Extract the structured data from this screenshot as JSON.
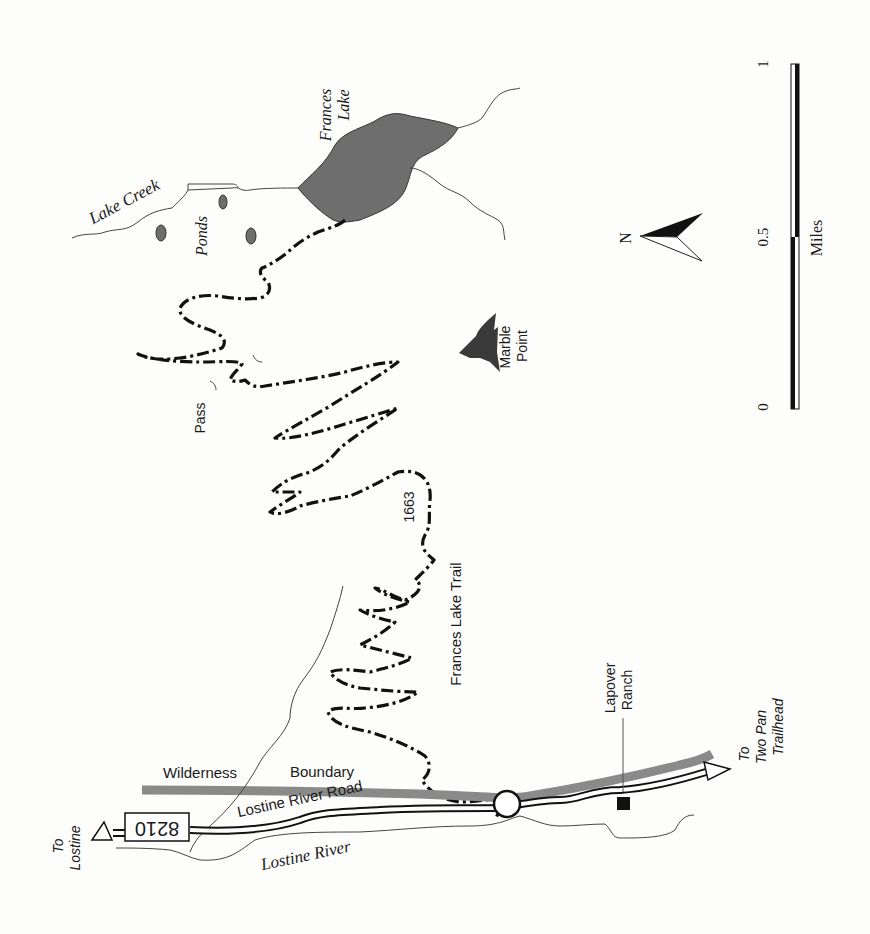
{
  "map": {
    "title": "Frances Lake Trail",
    "trail": {
      "name": "Frances Lake Trail",
      "number": "1663"
    },
    "features": {
      "lake": "Frances Lake",
      "creek": "Lake Creek",
      "ponds": "Ponds",
      "peak": "Marble Point",
      "pass": "Pass",
      "river": "Lostine River",
      "road": "Lostine River Road",
      "road_number": "8210",
      "boundary_word1": "Wilderness",
      "boundary_word2": "Boundary",
      "ranch_line1": "Lapover",
      "ranch_line2": "Ranch"
    },
    "directions": {
      "to_lostine_line1": "To",
      "to_lostine_line2": "Lostine",
      "to_twopan_line1": "To",
      "to_twopan_line2": "Two Pan",
      "to_twopan_line3": "Trailhead"
    },
    "north_arrow": {
      "label": "N"
    },
    "scale": {
      "unit": "Miles",
      "ticks": [
        "0",
        "0.5",
        "1"
      ]
    },
    "colors": {
      "water": "#6e6e6e",
      "boundary": "#8a8a8a",
      "trail": "#111111",
      "background": "#fdfdfc"
    }
  }
}
